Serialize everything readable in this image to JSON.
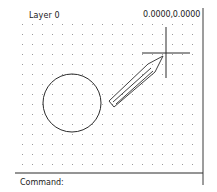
{
  "drawing_area": {
    "layer_label": "Layer 0",
    "coordinates": "0.0000,0.0000",
    "grid": {
      "spacing_px": 10,
      "color": "#9a9a9a"
    },
    "objects": [
      {
        "type": "circle",
        "cx": 72,
        "cy": 103,
        "r": 29,
        "stroke": "#2a2a2a"
      },
      {
        "type": "crosshair-cursor",
        "x": 166,
        "y": 53
      },
      {
        "type": "pencil-cursor",
        "tip_x": 163,
        "tip_y": 56
      }
    ]
  },
  "command_line": {
    "prompt": "Command:",
    "value": ""
  },
  "colors": {
    "background": "#ffffff",
    "line": "#2a2a2a",
    "text": "#1a1a1a"
  }
}
